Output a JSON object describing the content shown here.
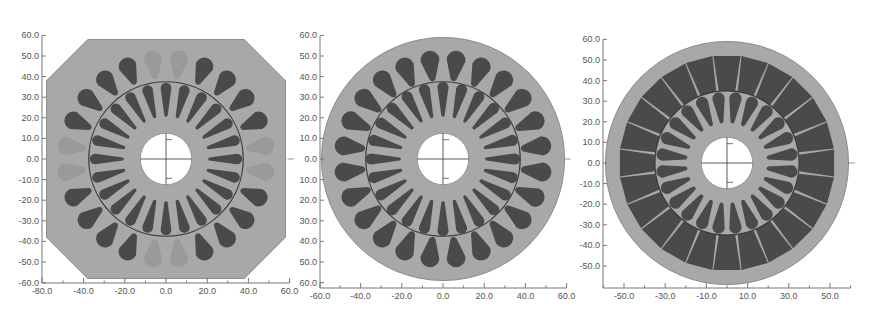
{
  "colors": {
    "background": "#ffffff",
    "lamination": "#a8a8a8",
    "lamination_edge": "#8c8c8c",
    "slot": "#4a4a4a",
    "slot_faint": "#9a9a9a",
    "airgap_line": "#3a3a3a",
    "shaft": "#ffffff",
    "axis": "#777777",
    "tick_text": "#555555"
  },
  "panels": [
    {
      "id": "panel-1",
      "name": "octagonal-stator-teardrop-slots",
      "origin_px": [
        166,
        159
      ],
      "scale_px_per_unit": 2.06,
      "y_axis_x_px": 42,
      "x_axis_y_px": 283,
      "x_ticks": [
        -80,
        -40,
        -20,
        0,
        20,
        40,
        60
      ],
      "x_tick_labels": [
        "-80.0",
        "-40.0",
        "-20.0",
        "0.0",
        "20.0",
        "40.0",
        "60.0"
      ],
      "x_minor": [
        -50,
        -30,
        -10,
        10,
        30,
        50
      ],
      "y_ticks": [
        60,
        50,
        40,
        30,
        20,
        10,
        0,
        -10,
        -20,
        -30,
        -40,
        -50,
        -60
      ],
      "y_tick_labels": [
        "60.0",
        "50.0",
        "40.0",
        "30.0",
        "20.0",
        "10.0",
        "0.0",
        "-10.0",
        "-20.0",
        "-30.0",
        "-40.0",
        "-50.0",
        "-60.0"
      ],
      "x_range": [
        -60,
        60
      ],
      "y_range": [
        -60,
        60
      ],
      "stator": {
        "shape": "octagon",
        "half_width": 58,
        "chamfer": 20
      },
      "stator_slots": {
        "count": 24,
        "offset_deg": 7.5,
        "r_inner": 40,
        "r_outer": 53,
        "w_inner": 2.2,
        "w_outer": 4.4,
        "style": "teardrop",
        "faint_indices": [
          0,
          5,
          6,
          11,
          12,
          17,
          18,
          23
        ]
      },
      "airgap_radius": 37.5,
      "rotor_slots": {
        "count": 24,
        "offset_deg": 0,
        "r_inner": 21,
        "r_outer": 37,
        "w_inner": 1.3,
        "w_outer": 2.6,
        "style": "teardrop"
      },
      "shaft_radius": 12.5
    },
    {
      "id": "panel-2",
      "name": "round-stator-teardrop-slots",
      "origin_px": [
        443,
        159
      ],
      "scale_px_per_unit": 2.06,
      "y_axis_x_px": 320,
      "x_axis_y_px": 288,
      "x_ticks": [
        -60,
        -40,
        -20,
        0,
        20,
        40,
        60
      ],
      "x_tick_labels": [
        "-60.0",
        "-40.0",
        "-20.0",
        "0.0",
        "20.0",
        "40.0",
        "60.0"
      ],
      "x_minor": [
        -50,
        -30,
        -10,
        10,
        30,
        50
      ],
      "y_ticks": [
        60,
        50,
        40,
        30,
        20,
        10,
        0,
        -10,
        -20,
        -30,
        -40,
        -50,
        -60
      ],
      "y_tick_labels": [
        "60.0",
        "50.0",
        "40.0",
        "30.0",
        "20.0",
        "10.0",
        "0.0",
        "10.0",
        "20.0",
        "30.0",
        "40.0",
        "50.0",
        "60.0"
      ],
      "stator": {
        "shape": "circle",
        "radius": 59
      },
      "stator_slots": {
        "count": 24,
        "offset_deg": 7.5,
        "r_inner": 39,
        "r_outer": 53,
        "w_inner": 2.4,
        "w_outer": 4.6,
        "style": "teardrop",
        "faint_indices": []
      },
      "airgap_radius": 37.5,
      "rotor_slots": {
        "count": 24,
        "offset_deg": 0,
        "r_inner": 21,
        "r_outer": 37.5,
        "w_inner": 1.3,
        "w_outer": 2.7,
        "style": "teardrop"
      },
      "shaft_radius": 12.5
    },
    {
      "id": "panel-3",
      "name": "round-stator-trapezoid-slots",
      "origin_px": [
        727,
        163
      ],
      "scale_px_per_unit": 2.06,
      "y_axis_x_px": 603,
      "x_axis_y_px": 288,
      "x_ticks": [
        -50,
        -30,
        -10,
        10,
        30,
        50
      ],
      "x_tick_labels": [
        "-50.0",
        "-30.0",
        "-10.0",
        "10.0",
        "30.0",
        "50.0"
      ],
      "x_minor": [
        -60,
        -40,
        -20,
        0,
        20,
        40,
        60
      ],
      "y_ticks": [
        60,
        50,
        40,
        30,
        20,
        10,
        0,
        -10,
        -20,
        -30,
        -40,
        -50
      ],
      "y_tick_labels": [
        "60.0",
        "50.0",
        "40.0",
        "30.0",
        "20.0",
        "10.0",
        "0.0",
        "-10.0",
        "-20.0",
        "-30.0",
        "-40.0",
        "-50.0"
      ],
      "stator": {
        "shape": "circle",
        "radius": 59
      },
      "stator_slots": {
        "count": 24,
        "offset_deg": 0,
        "r_inner": 35,
        "r_outer": 52,
        "w_inner": 4.0,
        "w_outer": 6.6,
        "style": "trapezoid",
        "faint_indices": []
      },
      "airgap_radius": 35,
      "rotor_slots": {
        "count": 24,
        "offset_deg": 7.5,
        "r_inner": 20,
        "r_outer": 34.5,
        "w_inner": 1.5,
        "w_outer": 3.0,
        "style": "teardrop"
      },
      "shaft_radius": 12.5
    }
  ]
}
